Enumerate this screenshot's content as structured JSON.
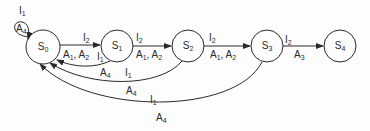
{
  "diagram": {
    "type": "state-transition",
    "states": [
      {
        "id": "S0",
        "label": "S",
        "sub": "0"
      },
      {
        "id": "S1",
        "label": "S",
        "sub": "1"
      },
      {
        "id": "S2",
        "label": "S",
        "sub": "2"
      },
      {
        "id": "S3",
        "label": "S",
        "sub": "3"
      },
      {
        "id": "S4",
        "label": "S",
        "sub": "4"
      }
    ],
    "transitions": [
      {
        "from": "S0",
        "to": "S0",
        "input": "I1",
        "action": "A4"
      },
      {
        "from": "S0",
        "to": "S1",
        "input": "I2",
        "action": "A1, A2"
      },
      {
        "from": "S1",
        "to": "S2",
        "input": "I2",
        "action": "A1, A2"
      },
      {
        "from": "S2",
        "to": "S3",
        "input": "I2",
        "action": "A1, A2"
      },
      {
        "from": "S3",
        "to": "S4",
        "input": "I2",
        "action": "A3"
      },
      {
        "from": "S1",
        "to": "S0",
        "input": "I1",
        "action": "A4"
      },
      {
        "from": "S2",
        "to": "S0",
        "input": "I1",
        "action": "A4"
      },
      {
        "from": "S3",
        "to": "S0",
        "input": "I1",
        "action": "A4"
      }
    ],
    "labels": {
      "self_in": "I",
      "self_in_sub": "1",
      "self_act": "A",
      "self_act_sub": "4",
      "t01_in": "I",
      "t01_in_sub": "2",
      "t01_act_a": "A",
      "t01_act_a_sub": "1",
      "t01_act_b": "A",
      "t01_act_b_sub": "2",
      "t12_in": "I",
      "t12_in_sub": "2",
      "t12_act_a": "A",
      "t12_act_a_sub": "1",
      "t12_act_b": "A",
      "t12_act_b_sub": "2",
      "t23_in": "I",
      "t23_in_sub": "2",
      "t23_act_a": "A",
      "t23_act_a_sub": "1",
      "t23_act_b": "A",
      "t23_act_b_sub": "2",
      "t34_in": "I",
      "t34_in_sub": "2",
      "t34_act": "A",
      "t34_act_sub": "3",
      "b10_in": "I",
      "b10_in_sub": "1",
      "b10_act": "A",
      "b10_act_sub": "4",
      "b20_in": "I",
      "b20_in_sub": "1",
      "b20_act": "A",
      "b20_act_sub": "4",
      "b30_in": "I",
      "b30_in_sub": "1",
      "b30_act": "A",
      "b30_act_sub": "4"
    }
  }
}
